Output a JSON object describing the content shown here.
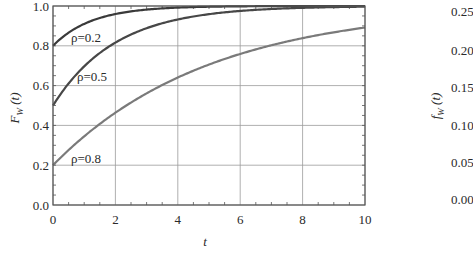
{
  "chart_data": [
    {
      "type": "line",
      "title": "",
      "xlabel": "t",
      "ylabel": "F_W (t)",
      "ylabel_main": "F",
      "ylabel_sub": "W",
      "ylabel_arg": " (t)",
      "xlim": [
        0,
        10
      ],
      "ylim": [
        0.0,
        1.0
      ],
      "x_ticks": [
        0,
        2,
        4,
        6,
        8,
        10
      ],
      "x_tick_labels": [
        "0",
        "2",
        "4",
        "6",
        "8",
        "10"
      ],
      "y_ticks": [
        0.0,
        0.2,
        0.4,
        0.6,
        0.8,
        1.0
      ],
      "y_tick_labels": [
        "0.0",
        "0.2",
        "0.4",
        "0.6",
        "0.8",
        "1.0"
      ],
      "grid": true,
      "legend": "inline labels",
      "x": [
        0,
        0.5,
        1,
        1.5,
        2,
        2.5,
        3,
        3.5,
        4,
        4.5,
        5,
        5.5,
        6,
        6.5,
        7,
        7.5,
        8,
        8.5,
        9,
        9.5,
        10
      ],
      "series": [
        {
          "name": "ρ=0.2",
          "label": "ρ=0.2",
          "color": "#3a3a3a",
          "values": [
            0.8,
            0.866,
            0.91,
            0.94,
            0.96,
            0.973,
            0.982,
            0.988,
            0.992,
            0.995,
            0.996,
            0.998,
            0.998,
            0.999,
            0.999,
            1.0,
            1.0,
            1.0,
            1.0,
            1.0,
            1.0
          ]
        },
        {
          "name": "ρ=0.5",
          "label": "ρ=0.5",
          "color": "#474747",
          "values": [
            0.5,
            0.611,
            0.697,
            0.764,
            0.816,
            0.857,
            0.888,
            0.913,
            0.932,
            0.947,
            0.959,
            0.968,
            0.975,
            0.981,
            0.985,
            0.988,
            0.991,
            0.993,
            0.994,
            0.996,
            0.997
          ]
        },
        {
          "name": "ρ=0.8",
          "label": "ρ=0.8",
          "color": "#7a7a7a",
          "values": [
            0.2,
            0.276,
            0.345,
            0.407,
            0.464,
            0.515,
            0.561,
            0.603,
            0.641,
            0.675,
            0.706,
            0.734,
            0.759,
            0.782,
            0.803,
            0.822,
            0.838,
            0.854,
            0.868,
            0.88,
            0.892
          ]
        }
      ]
    },
    {
      "type": "line",
      "partial": true,
      "ylabel": "f_W (t)",
      "ylabel_main": "f",
      "ylabel_sub": "W",
      "ylabel_arg": " (t)",
      "y_tick_labels": [
        "0.25",
        "0.20",
        "0.15",
        "0.10",
        "0.05",
        "0.00"
      ]
    }
  ],
  "labels": {
    "rho_02": "ρ=0.2",
    "rho_05": "ρ=0.5",
    "rho_08": "ρ=0.8"
  }
}
